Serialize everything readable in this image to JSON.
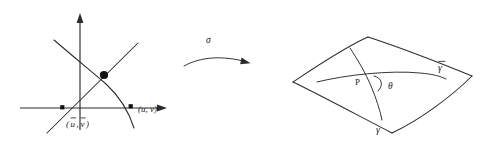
{
  "figure": {
    "kind": "math-diagram",
    "background_color": "#ffffff",
    "ink_color": "#2b2b2b",
    "width": 492,
    "height": 143
  },
  "left_panel": {
    "name": "parameter-plane",
    "axes": {
      "horizontal_label": "",
      "vertical_label": "",
      "has_arrowheads": true
    },
    "intersection_marker": "filled-circle",
    "points": [
      {
        "id": "point-ubar-vbar",
        "label": "(ū, v̄)",
        "label_parts": {
          "open": "(",
          "first": "u",
          "comma": ",",
          "second": "v",
          "close": ")"
        },
        "marker": "filled-square"
      },
      {
        "id": "point-u-v",
        "label": "(u, v)",
        "label_parts": {
          "open": "(",
          "first": "u",
          "comma": ",",
          "second": "v",
          "close": ")"
        },
        "marker": "filled-square"
      }
    ]
  },
  "map_arrow": {
    "name": "sigma-map-arrow",
    "label": "σ",
    "style": "curved-arrow-right"
  },
  "right_panel": {
    "name": "surface-patch",
    "shape": "curvilinear-quadrilateral",
    "point_label": "P",
    "angle_label": "θ",
    "curves": [
      {
        "id": "curve-gamma",
        "label": "γ",
        "has_bar": false
      },
      {
        "id": "curve-gamma-bar",
        "label": "γ",
        "has_bar": true
      }
    ]
  }
}
